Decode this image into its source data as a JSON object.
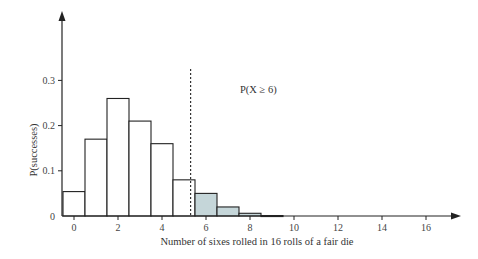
{
  "chart_data": {
    "type": "bar",
    "title": "",
    "xlabel": "Number of sixes rolled in 16 rolls of a fair die",
    "ylabel": "P(successes)",
    "x": [
      0,
      1,
      2,
      3,
      4,
      5,
      6,
      7,
      8,
      9,
      10,
      11,
      12,
      13,
      14,
      15,
      16
    ],
    "values": [
      0.054,
      0.17,
      0.26,
      0.21,
      0.16,
      0.08,
      0.05,
      0.02,
      0.006,
      0.001,
      0,
      0,
      0,
      0,
      0,
      0,
      0
    ],
    "highlighted_from": 6,
    "x_ticks": [
      "0",
      "2",
      "4",
      "6",
      "8",
      "10",
      "12",
      "14",
      "16"
    ],
    "y_ticks": [
      "0",
      "0.1",
      "0.2",
      "0.3"
    ],
    "ylim": [
      0,
      0.44
    ],
    "xlim": [
      -0.5,
      17.5
    ],
    "grid": false,
    "legend": null,
    "annotations": [
      {
        "text": "P(X ≥ 6)",
        "x": 8.2,
        "y": 0.3
      }
    ],
    "threshold_line": {
      "x": 5.3,
      "style": "dashed"
    },
    "colors": {
      "bar_fill": "#ffffff",
      "highlight_fill": "#c5d6d9",
      "stroke": "#222222"
    }
  }
}
